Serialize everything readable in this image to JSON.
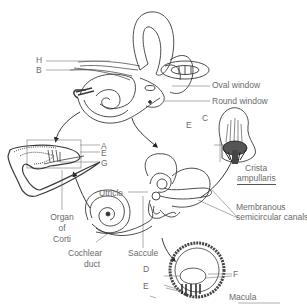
{
  "diagram": {
    "letter_labels": {
      "A": "A",
      "B": "B",
      "C": "C",
      "D": "D",
      "E_corti": "E",
      "E_crista": "E",
      "E_macula": "E",
      "F": "F",
      "G": "G",
      "H": "H"
    },
    "named_labels": {
      "oval_window": "Oval window",
      "round_window": "Round window",
      "crista_ampullaris_1": "Crista",
      "crista_ampullaris_2": "ampullaris",
      "membranous_canals_1": "Membranous",
      "membranous_canals_2": "semicircular canals",
      "utricle": "Utricle",
      "saccule": "Saccule",
      "cochlear_duct_1": "Cochlear",
      "cochlear_duct_2": "duct",
      "organ_of_corti_1": "Organ",
      "organ_of_corti_2": "of",
      "organ_of_corti_3": "Corti",
      "macula": "Macula"
    },
    "colors": {
      "line": "#3a3a3a",
      "text": "#6b6b6b",
      "background": "#ffffff"
    }
  }
}
